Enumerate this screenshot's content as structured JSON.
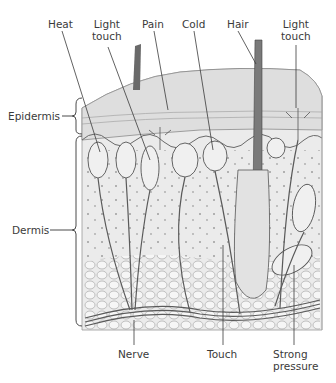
{
  "diagram": {
    "top_labels": [
      {
        "id": "heat",
        "text": "Heat"
      },
      {
        "id": "light-touch-1",
        "line1": "Light",
        "line2": "touch"
      },
      {
        "id": "pain",
        "text": "Pain"
      },
      {
        "id": "cold",
        "text": "Cold"
      },
      {
        "id": "hair",
        "text": "Hair"
      },
      {
        "id": "light-touch-2",
        "line1": "Light",
        "line2": "touch"
      }
    ],
    "side_labels": [
      {
        "id": "epidermis",
        "text": "Epidermis"
      },
      {
        "id": "dermis",
        "text": "Dermis"
      }
    ],
    "bottom_labels": [
      {
        "id": "nerve",
        "text": "Nerve"
      },
      {
        "id": "touch",
        "text": "Touch"
      },
      {
        "id": "strong-pressure",
        "line1": "Strong",
        "line2": "pressure"
      }
    ],
    "colors": {
      "line": "#3a3a3a",
      "tissue_fill": "#ececec",
      "epidermis_fill": "#e2e2e2",
      "background": "#ffffff"
    }
  }
}
